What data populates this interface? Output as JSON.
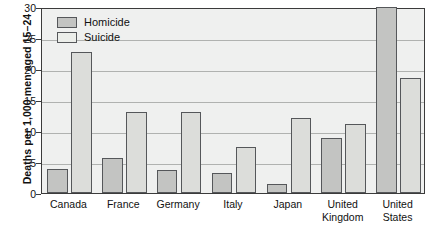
{
  "chart_data": {
    "type": "bar",
    "title": "",
    "subtitle": "",
    "xlabel": "",
    "ylabel": "Deaths per 1,000 men aged 15–24",
    "ylim": [
      0,
      30
    ],
    "yticks": [
      0,
      5,
      10,
      15,
      20,
      25,
      30
    ],
    "ytick_labels": [
      "0",
      "5",
      "10",
      "15",
      "20",
      "25",
      "30"
    ],
    "grid": true,
    "grid_axis": "y",
    "legend_position": "top-left",
    "categories": [
      "Canada",
      "France",
      "Germany",
      "Italy",
      "Japan",
      "United Kingdom",
      "United States"
    ],
    "category_lines": [
      [
        "Canada"
      ],
      [
        "France"
      ],
      [
        "Germany"
      ],
      [
        "Italy"
      ],
      [
        "Japan"
      ],
      [
        "United",
        "Kingdom"
      ],
      [
        "United",
        "States"
      ]
    ],
    "series": [
      {
        "name": "Homicide",
        "color": "#c3c4c2",
        "values": [
          3.8,
          5.6,
          3.7,
          3.3,
          1.4,
          8.8,
          30.0
        ]
      },
      {
        "name": "Suicide",
        "color": "#dcddda",
        "values": [
          22.8,
          13.1,
          13.1,
          7.4,
          12.1,
          11.2,
          18.5
        ]
      }
    ]
  },
  "legend": {
    "items": [
      {
        "label": "Homicide",
        "swatch": "homicide"
      },
      {
        "label": "Suicide",
        "swatch": "suicide"
      }
    ]
  },
  "colors": {
    "homicide_fill": "#c3c4c2",
    "suicide_fill": "#dcddda",
    "bar_outline": "#55575a",
    "plot_background": "#eff0ef",
    "plot_border": "#3b3b3b",
    "gridline": "#b0b2b0",
    "text": "#111111"
  }
}
